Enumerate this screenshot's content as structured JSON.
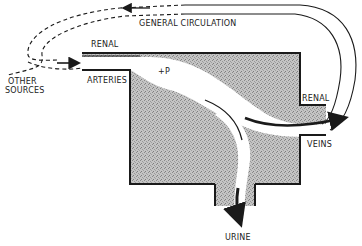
{
  "diagram": {
    "labels": {
      "general_circulation": "GENERAL CIRCULATION",
      "renal_artery_top": "RENAL",
      "arteries": "ARTERIES",
      "other_sources_1": "OTHER",
      "other_sources_2": "SOURCES",
      "pressure": "+P",
      "renal_vein_top": "RENAL",
      "veins": "VEINS",
      "urine": "URINE"
    },
    "colors": {
      "tissue_fill": "#b9b9b9",
      "outline": "#1a1a1a",
      "background": "#ffffff"
    }
  }
}
